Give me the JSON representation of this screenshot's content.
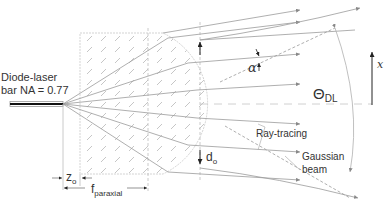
{
  "diagram": {
    "labels": {
      "source_line1": "Diode-laser",
      "source_line2": "bar NA = 0.77",
      "alpha": "α",
      "theta": "Θ",
      "theta_sub": "DL",
      "x_axis": "x",
      "d": "d",
      "d_sub": "o",
      "z": "z",
      "z_sub": "o",
      "f": "f",
      "f_sub": "paraxial",
      "ray_tracing": "Ray-tracing",
      "gaussian_line1": "Gaussian",
      "gaussian_line2": "beam"
    },
    "colors": {
      "line": "#9a9a9a",
      "dark": "#222222",
      "text": "#333333",
      "hatch": "#b5b5b5"
    }
  }
}
